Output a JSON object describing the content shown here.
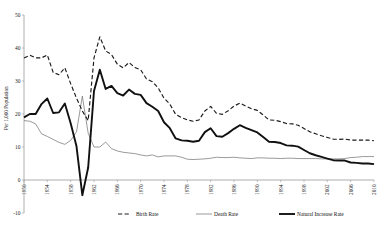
{
  "chart_data": {
    "type": "line",
    "title": "",
    "xlabel": "",
    "ylabel": "Per 1,000 Population",
    "ylim": [
      -10,
      50
    ],
    "yticks": [
      50,
      40,
      30,
      20,
      10,
      0,
      -10
    ],
    "ytick_labels": [
      "50",
      "40",
      "30",
      "20",
      "10",
      "0",
      "-10"
    ],
    "xlim": [
      1950,
      2010
    ],
    "xticks": [
      1950,
      1954,
      1958,
      1962,
      1966,
      1970,
      1974,
      1978,
      1982,
      1986,
      1990,
      1994,
      1998,
      2002,
      2006,
      2010
    ],
    "xtick_labels": [
      "1950",
      "1954",
      "1958",
      "1962",
      "1966",
      "1970",
      "1974",
      "1978",
      "1982",
      "1986",
      "1990",
      "1994",
      "1998",
      "2002",
      "2006",
      "2010"
    ],
    "grid": false,
    "legend_position": "bottom",
    "x": [
      1950,
      1951,
      1952,
      1953,
      1954,
      1955,
      1956,
      1957,
      1958,
      1959,
      1960,
      1961,
      1962,
      1963,
      1964,
      1965,
      1966,
      1967,
      1968,
      1969,
      1970,
      1971,
      1972,
      1973,
      1974,
      1975,
      1976,
      1977,
      1978,
      1979,
      1980,
      1981,
      1982,
      1983,
      1984,
      1985,
      1986,
      1987,
      1988,
      1989,
      1990,
      1991,
      1992,
      1993,
      1994,
      1995,
      1996,
      1997,
      1998,
      1999,
      2000,
      2001,
      2002,
      2003,
      2004,
      2005,
      2006,
      2007,
      2008,
      2009,
      2010
    ],
    "series": [
      {
        "name": "Birth Rate",
        "style": "dashed",
        "color": "#1a1a1a",
        "values": [
          37.0,
          37.8,
          37.0,
          37.0,
          37.9,
          32.6,
          31.9,
          34.0,
          29.2,
          24.8,
          20.9,
          18.0,
          37.0,
          43.4,
          39.1,
          38.0,
          35.1,
          34.0,
          35.6,
          34.1,
          33.4,
          30.6,
          29.8,
          27.9,
          24.8,
          23.0,
          19.9,
          18.9,
          18.2,
          17.8,
          18.2,
          20.9,
          22.3,
          20.2,
          19.9,
          21.0,
          22.4,
          23.3,
          22.4,
          21.6,
          21.1,
          19.7,
          18.2,
          18.1,
          17.7,
          17.1,
          17.0,
          16.6,
          15.6,
          14.6,
          14.0,
          13.4,
          12.9,
          12.4,
          12.3,
          12.4,
          12.1,
          12.1,
          12.1,
          12.1,
          11.9
        ]
      },
      {
        "name": "Death Rate",
        "style": "solid-thin",
        "color": "#6f6f6f",
        "values": [
          18.0,
          17.8,
          17.0,
          14.0,
          13.2,
          12.3,
          11.4,
          10.8,
          12.0,
          14.6,
          25.4,
          14.2,
          10.0,
          10.0,
          11.5,
          9.5,
          8.8,
          8.4,
          8.2,
          8.0,
          7.6,
          7.3,
          7.6,
          7.0,
          7.3,
          7.3,
          7.3,
          6.9,
          6.3,
          6.2,
          6.3,
          6.4,
          6.6,
          6.9,
          6.8,
          6.8,
          6.9,
          6.7,
          6.6,
          6.5,
          6.7,
          6.7,
          6.6,
          6.6,
          6.5,
          6.6,
          6.6,
          6.5,
          6.5,
          6.5,
          6.5,
          6.4,
          6.4,
          6.4,
          6.4,
          6.5,
          6.8,
          6.9,
          7.1,
          7.1,
          7.1
        ]
      },
      {
        "name": "Natural Increase Rate",
        "style": "solid-thick",
        "color": "#111111",
        "values": [
          19.0,
          20.0,
          20.0,
          23.0,
          24.7,
          20.3,
          20.5,
          23.2,
          17.2,
          10.2,
          -4.6,
          3.8,
          27.0,
          33.4,
          27.6,
          28.5,
          26.3,
          25.6,
          27.4,
          26.1,
          25.8,
          23.3,
          22.2,
          20.9,
          17.5,
          15.7,
          12.6,
          12.0,
          11.9,
          11.6,
          11.9,
          14.5,
          15.7,
          13.3,
          13.1,
          14.2,
          15.5,
          16.6,
          15.8,
          15.1,
          14.4,
          13.0,
          11.6,
          11.5,
          11.2,
          10.5,
          10.4,
          10.1,
          9.1,
          8.1,
          7.5,
          7.0,
          6.5,
          6.0,
          5.9,
          5.9,
          5.3,
          5.2,
          5.0,
          5.0,
          4.8
        ]
      }
    ],
    "legend": [
      {
        "label": "Birth Rate",
        "style": "dashed"
      },
      {
        "label": "Death Rate",
        "style": "solid-thin"
      },
      {
        "label": "Natural Increase Rate",
        "style": "solid-thick"
      }
    ]
  }
}
